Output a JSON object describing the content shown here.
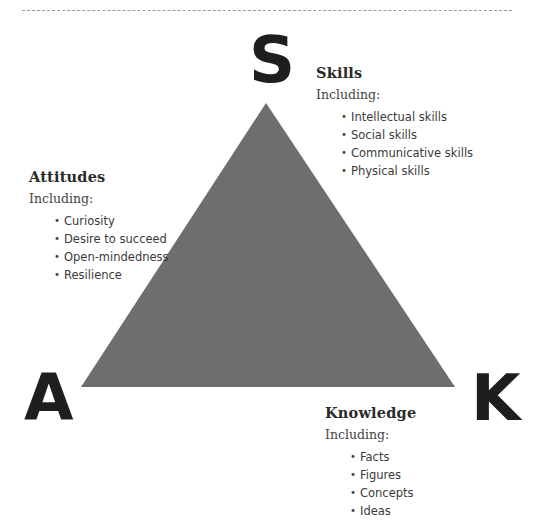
{
  "diagram": {
    "triangle": {
      "fill": "#6e6e6e",
      "apex": [
        266,
        103
      ],
      "bottom_left": [
        81,
        387
      ],
      "bottom_right": [
        455,
        387
      ]
    },
    "vertex_letters": {
      "top": "S",
      "bottom_left": "A",
      "bottom_right": "K"
    }
  },
  "skills": {
    "heading": "Skills",
    "intro": "Including:",
    "items": [
      "Intellectual skills",
      "Social skills",
      "Communicative skills",
      "Physical skills"
    ]
  },
  "attitudes": {
    "heading": "Attitudes",
    "intro": "Including:",
    "items": [
      "Curiosity",
      "Desire to succeed",
      "Open-mindedness",
      "Resilience"
    ]
  },
  "knowledge": {
    "heading": "Knowledge",
    "intro": "Including:",
    "items": [
      "Facts",
      "Figures",
      "Concepts",
      "Ideas"
    ]
  }
}
